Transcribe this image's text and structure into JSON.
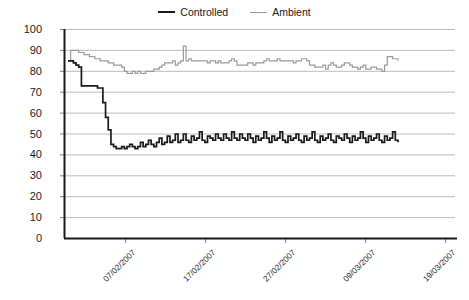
{
  "chart_data": {
    "type": "line",
    "title": "",
    "xlabel": "",
    "ylabel": "",
    "ylim": [
      0,
      100
    ],
    "ytick_labels": [
      "100",
      "90",
      "80",
      "70",
      "60",
      "50",
      "40",
      "30",
      "20",
      "10",
      "0"
    ],
    "ytick_values": [
      100,
      90,
      80,
      70,
      60,
      50,
      40,
      30,
      20,
      10,
      0
    ],
    "grid": true,
    "legend_position": "top-center",
    "xtick_labels": [
      "07/02/2007",
      "17/02/2007",
      "27/02/2007",
      "09/03/2007",
      "19/03/2007"
    ],
    "xtick_positions_px": [
      125,
      205,
      285,
      365,
      445
    ],
    "series": [
      {
        "name": "Controlled",
        "color": "#1a1a1a",
        "values": [
          85,
          85,
          84,
          83,
          82,
          73,
          73,
          73,
          73,
          73,
          73,
          72,
          72,
          65,
          58,
          52,
          45,
          44,
          43,
          43,
          44,
          43,
          44,
          45,
          44,
          43,
          44,
          46,
          44,
          45,
          47,
          45,
          44,
          46,
          48,
          45,
          46,
          49,
          46,
          47,
          50,
          46,
          47,
          50,
          47,
          46,
          49,
          47,
          48,
          51,
          47,
          46,
          49,
          48,
          47,
          50,
          48,
          47,
          50,
          48,
          47,
          51,
          48,
          47,
          50,
          48,
          47,
          50,
          48,
          46,
          49,
          47,
          48,
          51,
          48,
          46,
          49,
          47,
          48,
          51,
          47,
          46,
          49,
          47,
          48,
          50,
          47,
          46,
          49,
          47,
          48,
          51,
          47,
          46,
          49,
          47,
          48,
          50,
          47,
          46,
          49,
          48,
          47,
          50,
          48,
          46,
          49,
          47,
          48,
          51,
          48,
          46,
          49,
          47,
          48,
          50,
          47,
          46,
          49,
          47,
          48,
          51,
          47,
          46
        ]
      },
      {
        "name": "Ambient",
        "color": "#9a9a9a",
        "values": [
          85,
          90,
          90,
          90,
          89,
          89,
          88,
          88,
          87,
          87,
          86,
          86,
          85,
          85,
          85,
          84,
          84,
          83,
          83,
          83,
          82,
          80,
          79,
          79,
          80,
          79,
          80,
          79,
          79,
          80,
          80,
          80,
          81,
          81,
          82,
          83,
          84,
          84,
          84,
          85,
          83,
          84,
          85,
          92,
          85,
          86,
          85,
          85,
          85,
          85,
          85,
          85,
          84,
          85,
          85,
          84,
          85,
          84,
          84,
          84,
          85,
          86,
          85,
          83,
          83,
          83,
          83,
          84,
          84,
          83,
          84,
          84,
          84,
          85,
          86,
          85,
          85,
          85,
          86,
          85,
          85,
          85,
          85,
          85,
          84,
          85,
          85,
          86,
          86,
          85,
          83,
          83,
          82,
          82,
          82,
          83,
          81,
          83,
          84,
          83,
          82,
          82,
          83,
          84,
          84,
          83,
          82,
          82,
          81,
          82,
          83,
          81,
          81,
          82,
          82,
          81,
          81,
          80,
          83,
          87,
          87,
          86,
          86,
          85
        ]
      }
    ]
  },
  "legend": {
    "entries": [
      {
        "label": "Controlled"
      },
      {
        "label": "Ambient"
      }
    ]
  }
}
